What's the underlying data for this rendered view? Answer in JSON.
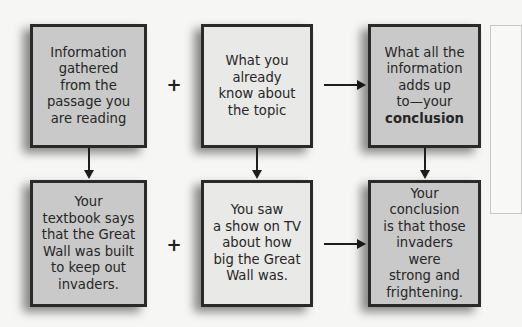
{
  "diagram": {
    "top_row": [
      {
        "text": "Information\ngathered\nfrom the\npassage you\nare reading",
        "shade": "dark"
      },
      {
        "text": "What you\nalready\nknow about\nthe topic",
        "shade": "light"
      },
      {
        "text_prefix": "What all the\ninformation\nadds up\nto—your\n",
        "text_bold": "conclusion",
        "shade": "dark"
      }
    ],
    "bottom_row": [
      {
        "text": "Your\ntextbook says\nthat the Great\nWall was built\nto keep out\ninvaders.",
        "shade": "dark"
      },
      {
        "text": "You saw\na show on TV\nabout how\nbig the Great\nWall was.",
        "shade": "light"
      },
      {
        "text": "Your\nconclusion\nis that those\ninvaders were\nstrong and\nfrightening.",
        "shade": "dark"
      }
    ],
    "operators": {
      "plus": "+"
    },
    "colors": {
      "dark_box": "#c9c9c9",
      "light_box": "#e9e9e7",
      "border": "#2a2a2a"
    }
  }
}
